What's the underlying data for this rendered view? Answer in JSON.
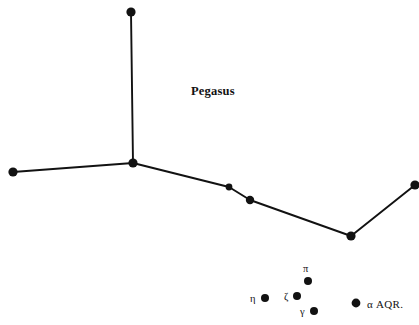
{
  "figure": {
    "kind": "star-chart",
    "background_color": "#ffffff",
    "ink_color": "#121212",
    "width": 419,
    "height": 325
  },
  "chart_data": {
    "type": "scatter",
    "title": "",
    "xlabel": "",
    "ylabel": "",
    "xlim": [
      0,
      419
    ],
    "ylim": [
      0,
      325
    ],
    "grid": false,
    "legend": "none",
    "constellations": [
      {
        "name": "Pegasus",
        "label": "Pegasus",
        "label_x": 213,
        "label_y": 91,
        "stars": [
          {
            "id": "p1",
            "label": "",
            "x": 131,
            "y": 12,
            "r": 4.6
          },
          {
            "id": "p2",
            "label": "",
            "x": 133,
            "y": 163,
            "r": 4.6
          },
          {
            "id": "p3",
            "label": "",
            "x": 13,
            "y": 172,
            "r": 4.6
          },
          {
            "id": "p4",
            "label": "",
            "x": 229,
            "y": 187,
            "r": 3.4
          },
          {
            "id": "p5",
            "label": "",
            "x": 250,
            "y": 200,
            "r": 4.2
          },
          {
            "id": "p6",
            "label": "",
            "x": 351,
            "y": 236,
            "r": 4.6
          },
          {
            "id": "p7",
            "label": "",
            "x": 415,
            "y": 185,
            "r": 4.6
          }
        ],
        "links": [
          [
            "p1",
            "p2"
          ],
          [
            "p2",
            "p3"
          ],
          [
            "p2",
            "p4"
          ],
          [
            "p4",
            "p5"
          ],
          [
            "p5",
            "p6"
          ],
          [
            "p6",
            "p7"
          ]
        ]
      },
      {
        "name": "Aquarius",
        "label": "",
        "label_x": 0,
        "label_y": 0,
        "stars": [
          {
            "id": "a-pi",
            "label": "π",
            "x": 308,
            "y": 281,
            "r": 4.0,
            "label_x": 308,
            "label_y": 269,
            "label_anchor": "middle"
          },
          {
            "id": "a-zeta",
            "label": "ζ",
            "x": 297,
            "y": 296,
            "r": 4.0,
            "label_x": 288,
            "label_y": 297,
            "label_anchor": "end"
          },
          {
            "id": "a-eta",
            "label": "η",
            "x": 265,
            "y": 298,
            "r": 4.0,
            "label_x": 256,
            "label_y": 299,
            "label_anchor": "end"
          },
          {
            "id": "a-gamma",
            "label": "γ",
            "x": 314,
            "y": 311,
            "r": 4.0,
            "label_x": 305,
            "label_y": 312,
            "label_anchor": "end"
          },
          {
            "id": "a-alpha",
            "label": "α AQR.",
            "x": 356,
            "y": 303,
            "r": 4.4,
            "label_x": 367,
            "label_y": 304,
            "label_anchor": "start"
          }
        ],
        "links": []
      }
    ],
    "labels": [
      {
        "text": "Pegasus",
        "x": 213,
        "y": 91,
        "style": "constellation-name"
      },
      {
        "text": "π",
        "x": 308,
        "y": 269,
        "style": "star-label"
      },
      {
        "text": "ζ",
        "x": 288,
        "y": 297,
        "style": "star-label"
      },
      {
        "text": "η",
        "x": 256,
        "y": 299,
        "style": "star-label"
      },
      {
        "text": "γ",
        "x": 305,
        "y": 312,
        "style": "star-label"
      },
      {
        "text": "α AQR.",
        "x": 367,
        "y": 304,
        "style": "bayer-label"
      }
    ],
    "line_style": {
      "color": "#121212",
      "width": 1.9,
      "cap": "round"
    },
    "star_style": {
      "fill": "#121212",
      "stroke": "none"
    }
  }
}
